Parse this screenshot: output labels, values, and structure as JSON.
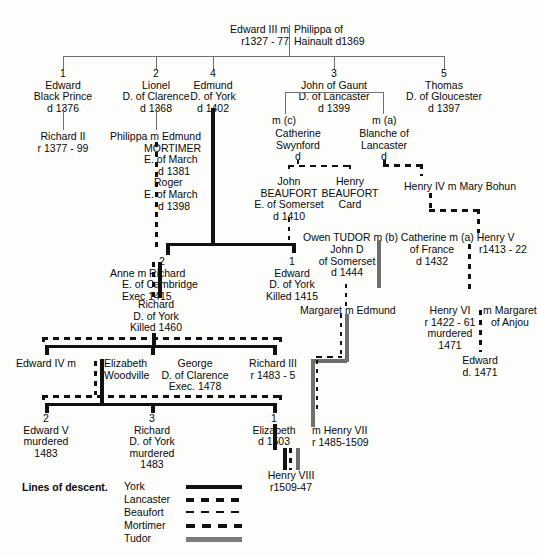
{
  "root": {
    "left": "Edward III m",
    "left_line2": "r1327 - 77",
    "right": "Philippa of",
    "right_line2": "Hainault d1369"
  },
  "generation2": [
    {
      "num": "1",
      "lines": [
        "Edward",
        "Black Prince",
        "d 1376"
      ]
    },
    {
      "num": "2",
      "lines": [
        "Lionel",
        "D. of Clarence",
        "d 1368"
      ]
    },
    {
      "num": "4",
      "lines": [
        "Edmund",
        "D. of York",
        "d 1402"
      ]
    },
    {
      "num": "3",
      "lines": [
        "John of Gaunt",
        "D. of Lancaster",
        "d 1399"
      ]
    },
    {
      "num": "5",
      "lines": [
        "Thomas",
        "D. of Gloucester",
        "d 1397"
      ]
    }
  ],
  "nodes": {
    "richard_ii": [
      "Richard II",
      "r 1377 - 99"
    ],
    "philippa_mortimer": [
      "Philippa m Edmund",
      "MORTIMER",
      "E. of March",
      "d 1381",
      "Roger",
      "E. of March",
      "d 1398"
    ],
    "marriage_c": "m (c)",
    "marriage_a": "m (a)",
    "catherine_swynford": [
      "Catherine",
      "Swynford",
      "d"
    ],
    "blanche_lancaster": [
      "Blanche of",
      "Lancaster",
      "d"
    ],
    "john_beaufort": [
      "John",
      "BEAUFORT",
      "E. of Somerset",
      "d 1410"
    ],
    "henry_beaufort": [
      "Henry",
      "BEAUFORT",
      "Card"
    ],
    "henry_iv": "Henry IV m Mary Bohun",
    "anne_richard": [
      "Anne m Richard",
      "E. of Cambridge",
      "Exec 1415"
    ],
    "anne_num": "2",
    "edward_york": [
      "Edward",
      "D. of York",
      "Killed 1415"
    ],
    "edward_york_num": "1",
    "owen_tudor": "Owen TUDOR m (b) Catherine m (a) Henry V",
    "owen_tudor_p1": "Owen TUDOR m (b)",
    "catherine_france": [
      "Catherine m (a)",
      "of France",
      "d 1432"
    ],
    "henry_v": [
      "Henry V",
      "r1413 - 22"
    ],
    "john_somerset": [
      "John D",
      "of Somerset",
      "d 1444"
    ],
    "richard_york_1460": [
      "Richard",
      "D. of York",
      "Killed 1460"
    ],
    "margaret_edmund": "Margaret m Edmund",
    "henry_vi": [
      "Henry VI",
      "r 1422 - 61",
      "murdered",
      "1471"
    ],
    "margaret_anjou": [
      "m Margaret",
      "of Anjou"
    ],
    "edward_1471": [
      "Edward",
      "d. 1471"
    ],
    "edward_iv": [
      "Edward IV m"
    ],
    "elizabeth_woodville": [
      "Elizabeth",
      "Woodville"
    ],
    "george_clarence": [
      "George",
      "D. of Clarence",
      "Exec. 1478"
    ],
    "richard_iii": [
      "Richard III",
      "r 1483 - 5"
    ],
    "edward_v": [
      "Edward V",
      "murdered",
      "1483"
    ],
    "edward_v_num": "2",
    "richard_york_murdered": [
      "Richard",
      "D. of York",
      "murdered",
      "1483"
    ],
    "richard_york_num": "3",
    "elizabeth_1503": [
      "Elizabeth",
      "d 1503"
    ],
    "elizabeth_num": "1",
    "henry_vii": [
      "m Henry VII",
      "r 1485-1509"
    ],
    "henry_viii": [
      "Henry VIII",
      "r1509-47"
    ]
  },
  "legend": {
    "title": "Lines of descent.",
    "entries": [
      {
        "label": "York",
        "style": "solid-black",
        "color": "#111111"
      },
      {
        "label": "Lancaster",
        "style": "thick-dashed",
        "color": "#111111"
      },
      {
        "label": "Beaufort",
        "style": "thin-dashed",
        "color": "#111111"
      },
      {
        "label": "Mortimer",
        "style": "thick-dashed",
        "color": "#111111"
      },
      {
        "label": "Tudor",
        "style": "solid-grey",
        "color": "#7a7a7a"
      }
    ]
  }
}
